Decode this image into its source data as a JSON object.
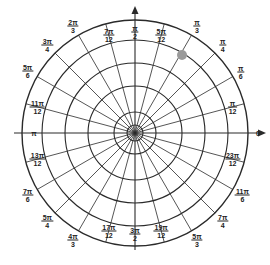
{
  "diagram": {
    "center": {
      "x": 135,
      "y": 133
    },
    "circle_radii": [
      8,
      21,
      47,
      70,
      93,
      113
    ],
    "spoke_inner_radius": 0,
    "spoke_outer_radius": 113,
    "spoke_count": 24,
    "axis": {
      "extend": 12,
      "arrow_right": true,
      "arrow_up": true
    },
    "colors": {
      "line": "#2a2a2a",
      "text": "#222222",
      "point": "#9a9a9a",
      "background": "#ffffff"
    },
    "point": {
      "x": 182,
      "y": 55,
      "r": 5,
      "label": "marked point"
    },
    "angle_labels": [
      {
        "id": "0",
        "num": "0",
        "den": "",
        "deg": 0,
        "r": 123
      },
      {
        "id": "pi-12",
        "num": "π",
        "den": "12",
        "deg": 15,
        "r": 101
      },
      {
        "id": "pi-6",
        "num": "π",
        "den": "6",
        "deg": 30,
        "r": 122
      },
      {
        "id": "pi-4",
        "num": "π",
        "den": "4",
        "deg": 45,
        "r": 124
      },
      {
        "id": "pi-3",
        "num": "π",
        "den": "3",
        "deg": 60,
        "r": 124
      },
      {
        "id": "5pi-12",
        "num": "5π",
        "den": "12",
        "deg": 75,
        "r": 101
      },
      {
        "id": "pi-2",
        "num": "π",
        "den": "2",
        "deg": 90,
        "r": 101
      },
      {
        "id": "7pi-12",
        "num": "7π",
        "den": "12",
        "deg": 105,
        "r": 101
      },
      {
        "id": "2pi-3",
        "num": "2π",
        "den": "3",
        "deg": 120,
        "r": 124
      },
      {
        "id": "3pi-4",
        "num": "3π",
        "den": "4",
        "deg": 135,
        "r": 124
      },
      {
        "id": "5pi-6",
        "num": "5π",
        "den": "6",
        "deg": 150,
        "r": 124
      },
      {
        "id": "11pi-12",
        "num": "11π",
        "den": "12",
        "deg": 165,
        "r": 101
      },
      {
        "id": "pi",
        "num": "π",
        "den": "",
        "deg": 180,
        "r": 101
      },
      {
        "id": "13pi-12",
        "num": "13π",
        "den": "12",
        "deg": 195,
        "r": 101
      },
      {
        "id": "7pi-6",
        "num": "7π",
        "den": "6",
        "deg": 210,
        "r": 124
      },
      {
        "id": "5pi-4",
        "num": "5π",
        "den": "4",
        "deg": 225,
        "r": 124
      },
      {
        "id": "4pi-3",
        "num": "4π",
        "den": "3",
        "deg": 240,
        "r": 124
      },
      {
        "id": "17pi-12",
        "num": "17π",
        "den": "12",
        "deg": 255,
        "r": 101
      },
      {
        "id": "3pi-2",
        "num": "3π",
        "den": "2",
        "deg": 270,
        "r": 101
      },
      {
        "id": "19pi-12",
        "num": "19π",
        "den": "12",
        "deg": 285,
        "r": 101
      },
      {
        "id": "5pi-3",
        "num": "5π",
        "den": "3",
        "deg": 300,
        "r": 124
      },
      {
        "id": "7pi-4",
        "num": "7π",
        "den": "4",
        "deg": 315,
        "r": 124
      },
      {
        "id": "11pi-6",
        "num": "11π",
        "den": "6",
        "deg": 330,
        "r": 124
      },
      {
        "id": "23pi-12",
        "num": "23π",
        "den": "12",
        "deg": 345,
        "r": 101
      }
    ]
  }
}
